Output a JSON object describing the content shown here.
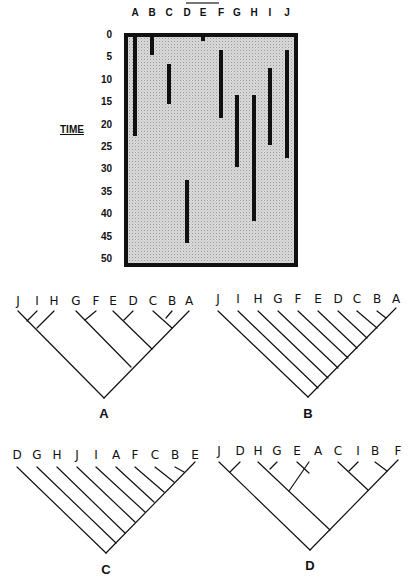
{
  "chart_data": {
    "type": "range-bar",
    "title": "",
    "xlabel": "",
    "ylabel": "TIME",
    "ylim": [
      0,
      50
    ],
    "yticks": [
      0,
      5,
      10,
      15,
      20,
      25,
      30,
      35,
      40,
      45,
      50
    ],
    "categories": [
      "A",
      "B",
      "C",
      "D",
      "E",
      "F",
      "G",
      "H",
      "I",
      "J"
    ],
    "ranges": [
      {
        "taxon": "A",
        "start": 0,
        "end": 22
      },
      {
        "taxon": "B",
        "start": 0,
        "end": 4
      },
      {
        "taxon": "C",
        "start": 6,
        "end": 15
      },
      {
        "taxon": "D",
        "start": 32,
        "end": 46
      },
      {
        "taxon": "E",
        "start": 0,
        "end": 1
      },
      {
        "taxon": "F",
        "start": 3,
        "end": 18
      },
      {
        "taxon": "G",
        "start": 13,
        "end": 29
      },
      {
        "taxon": "H",
        "start": 13,
        "end": 41
      },
      {
        "taxon": "I",
        "start": 7,
        "end": 24
      },
      {
        "taxon": "J",
        "start": 3,
        "end": 27
      }
    ],
    "grid": false,
    "legend": null
  },
  "chart": {
    "ylabel": "TIME",
    "columns": [
      "A",
      "B",
      "C",
      "D",
      "E",
      "F",
      "G",
      "H",
      "I",
      "J"
    ],
    "ticks": [
      "0",
      "5",
      "10",
      "15",
      "20",
      "25",
      "30",
      "35",
      "40",
      "45",
      "50"
    ]
  },
  "cladograms": [
    {
      "name": "A",
      "tips": [
        "J",
        "I",
        "H",
        "G",
        "F",
        "E",
        "D",
        "C",
        "B",
        "A"
      ],
      "newick": "(((J,I),H),((G,F),((E,D),((C,B),A))))"
    },
    {
      "name": "B",
      "tips": [
        "J",
        "I",
        "H",
        "G",
        "F",
        "E",
        "D",
        "C",
        "B",
        "A"
      ],
      "newick": "(J,(I,(H,(G,(F,(E,(D,(C,(B,A)))))))))"
    },
    {
      "name": "C",
      "tips": [
        "D",
        "G",
        "H",
        "J",
        "I",
        "A",
        "F",
        "C",
        "B",
        "E"
      ],
      "newick": "(D,(G,(H,(J,(I,(A,(F,(C,(B,E)))))))))"
    },
    {
      "name": "D",
      "tips": [
        "J",
        "D",
        "H",
        "G",
        "E",
        "A",
        "C",
        "I",
        "B",
        "F"
      ],
      "newick": "((J,D),((H,G),(E,A)),((C,I),(B,F)))"
    }
  ]
}
